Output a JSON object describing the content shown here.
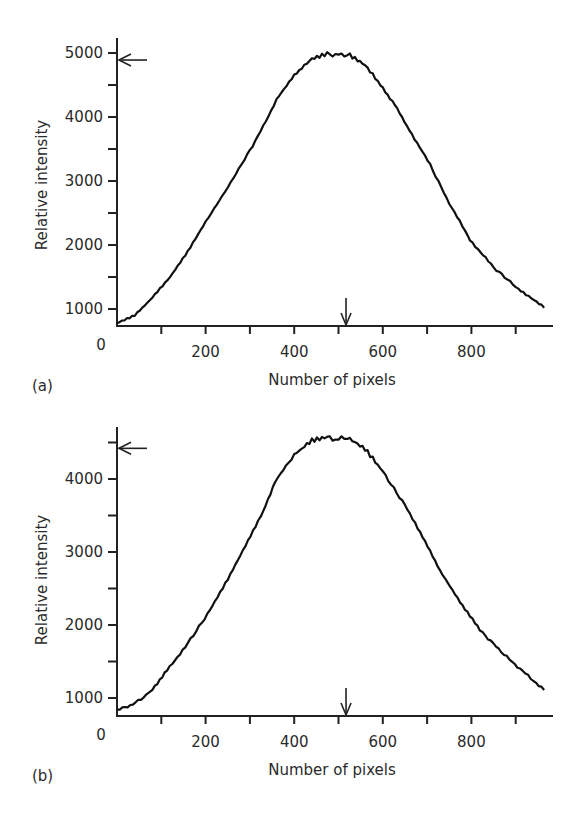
{
  "figure": {
    "panels": [
      {
        "id": "a",
        "panel_label": "(a)",
        "xlabel": "Number of pixels",
        "ylabel": "Relative intensity",
        "origin_label": "0",
        "x_tick_labels": [
          "200",
          "400",
          "600",
          "800"
        ],
        "y_tick_labels": [
          "1000",
          "2000",
          "3000",
          "4000",
          "5000"
        ]
      },
      {
        "id": "b",
        "panel_label": "(b)",
        "xlabel": "Number of pixels",
        "ylabel": "Relative intensity",
        "origin_label": "0",
        "x_tick_labels": [
          "200",
          "400",
          "600",
          "800"
        ],
        "y_tick_labels": [
          "1000",
          "2000",
          "3000",
          "4000"
        ]
      }
    ]
  },
  "chart_data": [
    {
      "type": "line",
      "title": "",
      "panel": "(a)",
      "xlabel": "Number of pixels",
      "ylabel": "Relative intensity",
      "xlim": [
        0,
        980
      ],
      "ylim": [
        730,
        5150
      ],
      "x_ticks": [
        100,
        200,
        300,
        400,
        500,
        600,
        700,
        800,
        900
      ],
      "x_tick_labels": [
        "",
        "200",
        "",
        "400",
        "",
        "600",
        "",
        "800",
        ""
      ],
      "y_ticks": [
        1000,
        1500,
        2000,
        2500,
        3000,
        3500,
        4000,
        4500,
        5000
      ],
      "y_tick_labels": [
        "1000",
        "",
        "2000",
        "",
        "3000",
        "",
        "4000",
        "",
        "5000"
      ],
      "grid": false,
      "legend": null,
      "annotations": [
        {
          "type": "arrow-left",
          "at_y": 4890,
          "note": "peak-level marker on y-axis"
        },
        {
          "type": "arrow-down",
          "at_x": 517,
          "note": "peak-position marker on x-axis"
        }
      ],
      "series": [
        {
          "name": "intensity profile (a)",
          "x": [
            0,
            40,
            74,
            120,
            160,
            200,
            250,
            300,
            330,
            360,
            400,
            440,
            480,
            500,
            520,
            560,
            600,
            627,
            660,
            707,
            750,
            797,
            850,
            900,
            964
          ],
          "y": [
            780,
            900,
            1140,
            1500,
            1900,
            2360,
            2900,
            3480,
            3850,
            4270,
            4650,
            4900,
            4990,
            4960,
            4980,
            4800,
            4450,
            4190,
            3800,
            3250,
            2650,
            2080,
            1650,
            1350,
            1020
          ]
        }
      ]
    },
    {
      "type": "line",
      "title": "",
      "panel": "(b)",
      "xlabel": "Number of pixels",
      "ylabel": "Relative intensity",
      "xlim": [
        0,
        980
      ],
      "ylim": [
        750,
        4700
      ],
      "x_ticks": [
        100,
        200,
        300,
        400,
        500,
        600,
        700,
        800,
        900
      ],
      "x_tick_labels": [
        "",
        "200",
        "",
        "400",
        "",
        "600",
        "",
        "800",
        ""
      ],
      "y_ticks": [
        1000,
        1500,
        2000,
        2500,
        3000,
        3500,
        4000,
        4500
      ],
      "y_tick_labels": [
        "1000",
        "",
        "2000",
        "",
        "3000",
        "",
        "4000",
        ""
      ],
      "grid": false,
      "legend": null,
      "annotations": [
        {
          "type": "arrow-left",
          "at_y": 4420,
          "note": "peak-level marker on y-axis"
        },
        {
          "type": "arrow-down",
          "at_x": 517,
          "note": "peak-position marker on x-axis"
        }
      ],
      "series": [
        {
          "name": "intensity profile (b)",
          "x": [
            0,
            30,
            60,
            80,
            113,
            160,
            210,
            250,
            290,
            330,
            357,
            400,
            440,
            480,
            500,
            520,
            560,
            600,
            650,
            690,
            729,
            780,
            819,
            880,
            964
          ],
          "y": [
            830,
            900,
            1000,
            1120,
            1380,
            1750,
            2200,
            2620,
            3080,
            3550,
            3970,
            4330,
            4520,
            4570,
            4540,
            4560,
            4400,
            4100,
            3640,
            3200,
            2750,
            2270,
            1930,
            1560,
            1110
          ]
        }
      ]
    }
  ]
}
